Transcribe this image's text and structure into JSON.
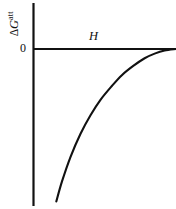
{
  "chart_data": {
    "type": "line",
    "title": "",
    "subtitle": "",
    "xlabel": "H",
    "ylabel": "ΔG",
    "ylabel_superscript": "att",
    "ylabel_delta": "Δ",
    "ylabel_symbol": "G",
    "xlabel_full": "H",
    "tick_labels": {
      "y": [
        "0"
      ],
      "x": []
    },
    "axis_origin_label": "0",
    "grid": false,
    "legend": false,
    "legend_position": "none",
    "xlim": [
      0,
      1
    ],
    "ylim": [
      -1,
      0.1
    ],
    "annotations": [],
    "series": [
      {
        "name": "attraction free energy",
        "description": "Monotonically increasing negative curve rising steeply from a large negative value and asymptotically approaching zero at large H",
        "x": [
          0.16,
          0.2,
          0.26,
          0.33,
          0.4,
          0.47,
          0.55,
          0.62,
          0.7,
          0.78,
          0.85,
          0.92,
          1.0
        ],
        "y": [
          -0.99,
          -0.86,
          -0.7,
          -0.55,
          -0.43,
          -0.33,
          -0.24,
          -0.17,
          -0.11,
          -0.06,
          -0.03,
          -0.01,
          0.0
        ]
      }
    ]
  },
  "figure": {
    "axis_color": "#111111",
    "curve_color": "#111111",
    "background": "#ffffff"
  }
}
